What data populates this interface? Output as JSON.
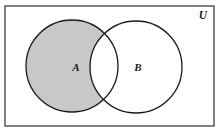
{
  "figure": {
    "type": "venn-diagram",
    "width": 220,
    "height": 135,
    "background_color": "#ffffff"
  },
  "universe": {
    "label": "U",
    "label_x": 203,
    "label_y": 19,
    "rect": {
      "x": 5,
      "y": 6,
      "width": 209,
      "height": 120
    },
    "border_color": "#4d4d4d",
    "border_width": 1.4,
    "fill_color": "#ffffff"
  },
  "sets": [
    {
      "name": "set-a",
      "label": "A",
      "label_x": 76,
      "label_y": 71,
      "cx": 72,
      "cy": 66,
      "r": 46,
      "outline_color": "#1a1a1a",
      "outline_width": 1.3,
      "fill_color": "#ffffff"
    },
    {
      "name": "set-b",
      "label": "B",
      "label_x": 138,
      "label_y": 71,
      "cx": 136,
      "cy": 67,
      "r": 46,
      "outline_color": "#1a1a1a",
      "outline_width": 1.3,
      "fill_color": "#ffffff"
    }
  ],
  "shaded_region": {
    "name": "a-minus-b",
    "expression": "A \\ B",
    "fill_color": "#c8c8c8",
    "shaded": true
  },
  "unshaded_regions": [
    {
      "name": "a-intersect-b",
      "expression": "A ∩ B",
      "fill_color": "#ffffff"
    },
    {
      "name": "b-minus-a",
      "expression": "B \\ A",
      "fill_color": "#ffffff"
    },
    {
      "name": "outside-both",
      "expression": "U \\ (A ∪ B)",
      "fill_color": "#ffffff"
    }
  ]
}
